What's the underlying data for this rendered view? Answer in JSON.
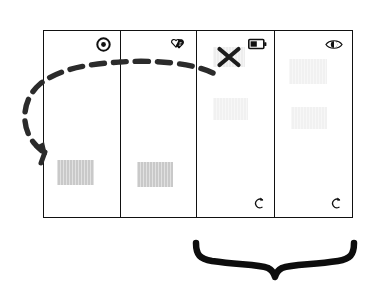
{
  "diagram": {
    "frame": {
      "border_color": "#111111",
      "background": "#ffffff"
    },
    "panels": [
      {
        "id": "panel-1",
        "index": 1,
        "icon": "target-dot-icon",
        "icon_label": "record target",
        "blocks": [
          {
            "name": "content-block",
            "shade": "#c9c9c9"
          }
        ],
        "has_reload": false,
        "has_x_mark": false
      },
      {
        "id": "panel-2",
        "index": 2,
        "icon": "handshake-icon",
        "icon_label": "handshake",
        "blocks": [
          {
            "name": "content-block",
            "shade": "#c9c9c9"
          }
        ],
        "has_reload": false,
        "has_x_mark": false
      },
      {
        "id": "panel-3",
        "index": 3,
        "icon": "battery-icon",
        "icon_label": "battery half",
        "blocks": [
          {
            "name": "content-block",
            "shade": "#ededed"
          },
          {
            "name": "content-block",
            "shade": "#f1f1f1"
          }
        ],
        "has_reload": true,
        "reload_icon": "reload-arrow-icon",
        "has_x_mark": true,
        "x_mark_icon": "x-cross-icon"
      },
      {
        "id": "panel-4",
        "index": 4,
        "icon": "eye-icon",
        "icon_label": "eye",
        "blocks": [
          {
            "name": "content-block",
            "shade": "#f1f1f1"
          },
          {
            "name": "content-block",
            "shade": "#f1f1f1"
          }
        ],
        "has_reload": true,
        "reload_icon": "reload-arrow-icon",
        "has_x_mark": false
      }
    ],
    "annotations": {
      "dashed_arrow": {
        "name": "dashed-loop-arrow",
        "color": "#2b2b2b",
        "style": "dashed",
        "from_panel": 3,
        "to_panel": 1,
        "direction": "right-to-left, looping below left edge, arrowhead pointing down-left"
      },
      "brace": {
        "name": "bottom-curly-brace",
        "color": "#0d0d0d",
        "spans_panels": [
          3,
          4
        ],
        "orientation": "bottom"
      }
    }
  }
}
